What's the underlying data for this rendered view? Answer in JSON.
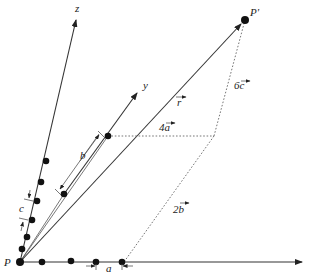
{
  "diagram": {
    "title": "",
    "labels": {
      "origin": "P",
      "endpoint": "P'",
      "z_axis": "z",
      "y_axis": "y",
      "r_vector": "r",
      "a_spacing": "a",
      "b_spacing": "b",
      "c_spacing": "c",
      "four_a": "4a",
      "six_c": "6c",
      "two_b": "2b"
    },
    "points": {
      "P": [
        20,
        262
      ],
      "P_prime": [
        245,
        20
      ]
    },
    "x_axis_dots": [
      [
        20,
        262
      ],
      [
        42,
        262
      ],
      [
        71,
        261
      ],
      [
        96,
        262
      ],
      [
        122,
        262
      ]
    ],
    "z_axis_dots": [
      [
        22,
        250
      ],
      [
        28,
        236
      ],
      [
        33,
        221
      ],
      [
        38,
        200
      ],
      [
        42,
        182
      ],
      [
        47,
        161
      ]
    ],
    "y_axis_dots": [
      [
        64,
        194
      ],
      [
        108,
        136
      ]
    ],
    "colors": {
      "line": "#333333",
      "dashed": "#666666",
      "dot": "#111111",
      "text": "#222222"
    }
  }
}
